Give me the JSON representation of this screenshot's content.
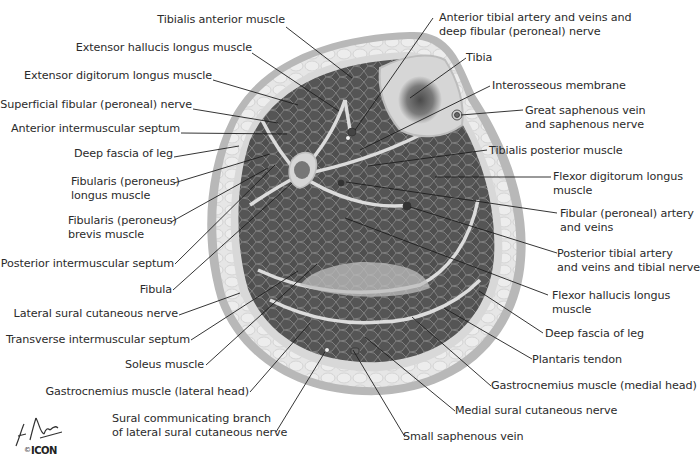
{
  "figure": {
    "colors": {
      "muscle": "#4f4f4f",
      "muscle_cell_line": "#8a8a8a",
      "fat": "#e4e4e4",
      "skin": "#b8b8b8",
      "septum": "#dcdcdc",
      "bone": "#d6d6d6",
      "marrow": "#5e5e5e",
      "leader_line": "#1e1e1e",
      "label_text": "#2b2b2b"
    },
    "labels_left": [
      {
        "id": "tibialis-anterior-muscle",
        "text": "Tibialis anterior muscle"
      },
      {
        "id": "extensor-hallucis-longus-muscle",
        "text": "Extensor hallucis longus muscle"
      },
      {
        "id": "extensor-digitorum-longus-muscle",
        "text": "Extensor digitorum longus muscle"
      },
      {
        "id": "superficial-fibular-nerve",
        "text": "Superficial fibular (peroneal) nerve"
      },
      {
        "id": "anterior-intermuscular-septum",
        "text": "Anterior intermuscular septum"
      },
      {
        "id": "deep-fascia-of-leg-left",
        "text": "Deep fascia of leg"
      },
      {
        "id": "fibularis-longus-muscle",
        "line1": "Fibularis (peroneus)",
        "line2": "longus muscle"
      },
      {
        "id": "fibularis-brevis-muscle",
        "line1": "Fibularis (peroneus)",
        "line2": "brevis muscle"
      },
      {
        "id": "posterior-intermuscular-septum",
        "text": "Posterior intermuscular septum"
      },
      {
        "id": "fibula",
        "text": "Fibula"
      },
      {
        "id": "lateral-sural-cutaneous-nerve",
        "text": "Lateral sural cutaneous nerve"
      },
      {
        "id": "transverse-intermuscular-septum",
        "text": "Transverse intermuscular septum"
      },
      {
        "id": "soleus-muscle",
        "text": "Soleus muscle"
      },
      {
        "id": "gastrocnemius-lateral-head",
        "text": "Gastrocnemius muscle (lateral head)"
      },
      {
        "id": "sural-communicating-branch",
        "line1": "Sural communicating branch",
        "line2": "of lateral sural cutaneous nerve"
      }
    ],
    "labels_right": [
      {
        "id": "anterior-tibial-artery",
        "line1": "Anterior tibial artery and veins and",
        "line2": "deep fibular (peroneal) nerve"
      },
      {
        "id": "tibia",
        "text": "Tibia"
      },
      {
        "id": "interosseous-membrane",
        "text": "Interosseous membrane"
      },
      {
        "id": "great-saphenous-vein",
        "line1": "Great saphenous vein",
        "line2": "and saphenous nerve"
      },
      {
        "id": "tibialis-posterior-muscle",
        "text": "Tibialis posterior muscle"
      },
      {
        "id": "flexor-digitorum-longus",
        "line1": "Flexor digitorum longus",
        "line2": "muscle"
      },
      {
        "id": "fibular-artery",
        "line1": "Fibular (peroneal) artery",
        "line2": "and veins"
      },
      {
        "id": "posterior-tibial-artery",
        "line1": "Posterior tibial artery",
        "line2": "and veins and tibial nerve"
      },
      {
        "id": "flexor-hallucis-longus",
        "line1": "Flexor hallucis longus",
        "line2": "muscle"
      },
      {
        "id": "deep-fascia-of-leg-right",
        "text": "Deep fascia of leg"
      },
      {
        "id": "plantaris-tendon",
        "text": "Plantaris tendon"
      },
      {
        "id": "gastrocnemius-medial-head",
        "text": "Gastrocnemius muscle (medial head)"
      },
      {
        "id": "medial-sural-cutaneous-nerve",
        "text": "Medial sural cutaneous nerve"
      },
      {
        "id": "small-saphenous-vein",
        "text": "Small saphenous vein"
      }
    ],
    "signature": {
      "text": "F. Netter M.D.",
      "copyright": "©",
      "publisher": "ICON"
    }
  }
}
